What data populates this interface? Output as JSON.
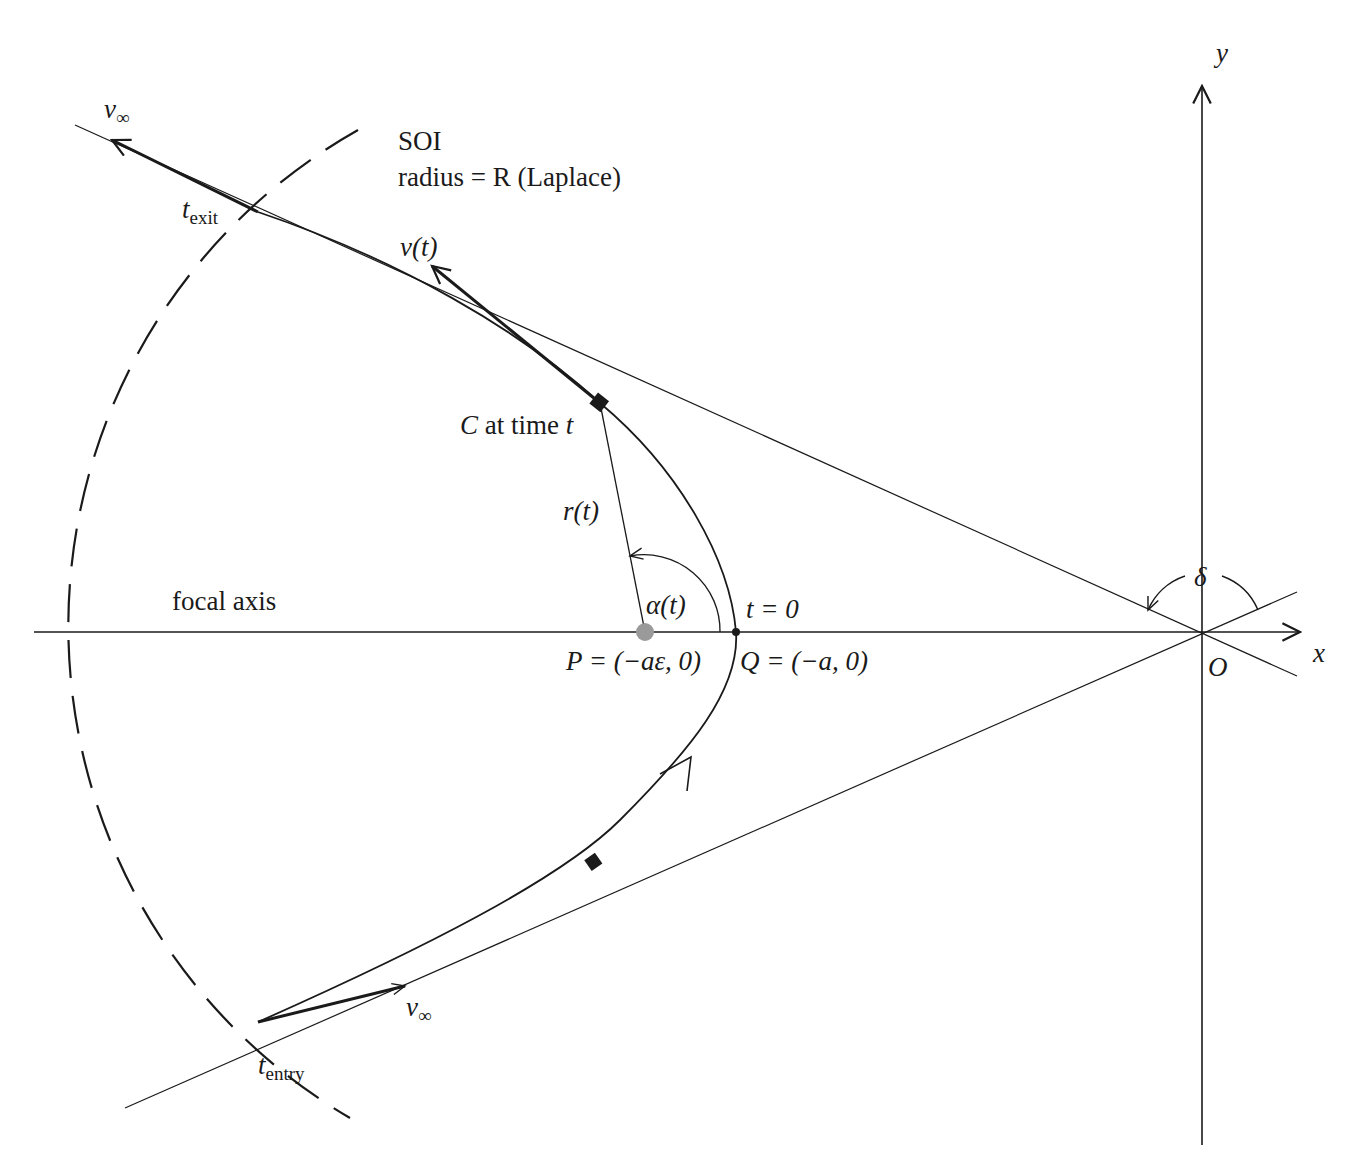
{
  "diagram": {
    "colors": {
      "ink": "#1a1a1a",
      "focus_dot": "#9a9a9a",
      "background": "#ffffff"
    },
    "axes": {
      "x_label": "x",
      "y_label": "y",
      "origin_label": "O"
    },
    "labels": {
      "v_inf_exit": "v",
      "v_inf_exit_sub": "∞",
      "soi_title": "SOI",
      "soi_radius": "radius = R (Laplace)",
      "t_exit": "t",
      "t_exit_sub": "exit",
      "v_t": "v(t)",
      "c_at_time_c": "C",
      "c_at_time_rest": " at time ",
      "c_at_time_t": "t",
      "r_t": "r(t)",
      "alpha_t": "α(t)",
      "t_zero": "t = 0",
      "focal_axis": "focal axis",
      "p_label": "P = (−aε, 0)",
      "q_label": "Q = (−a, 0)",
      "delta": "δ",
      "v_inf_entry": "v",
      "v_inf_entry_sub": "∞",
      "t_entry": "t",
      "t_entry_sub": "entry"
    },
    "points": {
      "origin_O": [
        1202,
        632
      ],
      "focus_P": [
        645,
        632
      ],
      "vertex_Q": [
        736,
        632
      ],
      "craft_C": [
        600,
        403
      ],
      "marker_lower": [
        594,
        862
      ],
      "exit_point": [
        258,
        212
      ],
      "entry_point": [
        258,
        1022
      ]
    }
  }
}
